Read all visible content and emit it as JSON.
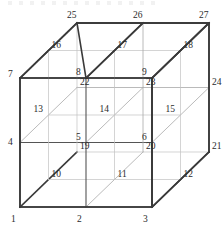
{
  "figure": {
    "type": "diagram",
    "line_colors": {
      "outer_edge": "#3a3a3a",
      "mid_edge": "#555555",
      "inner_edge": "#a8a8a8",
      "faint_edge": "#c2c2c2"
    },
    "label_color": "#2b2b2b"
  },
  "geometry": {
    "origin": {
      "x": 20,
      "y": 207
    },
    "step_x": 66,
    "step_y": -64.5,
    "depth_x": 28.5,
    "depth_y": -27.5,
    "grid": 3
  },
  "vertices": [
    {
      "id": "1",
      "label": "1",
      "i": 0,
      "j": 0,
      "k": 0,
      "lx": -9,
      "ly": 13
    },
    {
      "id": "2",
      "label": "2",
      "i": 1,
      "j": 0,
      "k": 0,
      "lx": -9,
      "ly": 13
    },
    {
      "id": "3",
      "label": "3",
      "i": 2,
      "j": 0,
      "k": 0,
      "lx": -9,
      "ly": 13
    },
    {
      "id": "4",
      "label": "4",
      "i": 0,
      "j": 1,
      "k": 0,
      "lx": -12,
      "ly": 0
    },
    {
      "id": "5",
      "label": "5",
      "i": 1,
      "j": 1,
      "k": 0,
      "lx": -10,
      "ly": -5
    },
    {
      "id": "6",
      "label": "6",
      "i": 2,
      "j": 1,
      "k": 0,
      "lx": -10,
      "ly": -5
    },
    {
      "id": "7",
      "label": "7",
      "i": 0,
      "j": 2,
      "k": 0,
      "lx": -12,
      "ly": -3
    },
    {
      "id": "8",
      "label": "8",
      "i": 1,
      "j": 2,
      "k": 0,
      "lx": -10,
      "ly": -5
    },
    {
      "id": "9",
      "label": "9",
      "i": 2,
      "j": 2,
      "k": 0,
      "lx": -10,
      "ly": -5
    },
    {
      "id": "10",
      "label": "10",
      "i": 0,
      "j": 0,
      "k": 1,
      "lx": 3,
      "ly": -5
    },
    {
      "id": "11",
      "label": "11",
      "i": 1,
      "j": 0,
      "k": 1,
      "lx": 3,
      "ly": -5
    },
    {
      "id": "12",
      "label": "12",
      "i": 2,
      "j": 0,
      "k": 1,
      "lx": 3,
      "ly": -5
    },
    {
      "id": "13",
      "label": "13",
      "i": 0,
      "j": 1,
      "k": 1,
      "lx": -15,
      "ly": -5
    },
    {
      "id": "14",
      "label": "14",
      "i": 1,
      "j": 1,
      "k": 1,
      "lx": -15,
      "ly": -5
    },
    {
      "id": "15",
      "label": "15",
      "i": 2,
      "j": 1,
      "k": 1,
      "lx": -15,
      "ly": -5
    },
    {
      "id": "16",
      "label": "16",
      "i": 0,
      "j": 2,
      "k": 1,
      "lx": 3,
      "ly": -5
    },
    {
      "id": "17",
      "label": "17",
      "i": 1,
      "j": 2,
      "k": 1,
      "lx": 3,
      "ly": -5
    },
    {
      "id": "18",
      "label": "18",
      "i": 2,
      "j": 2,
      "k": 1,
      "lx": 3,
      "ly": -5
    },
    {
      "id": "19",
      "label": "19",
      "i": 0,
      "j": 0,
      "k": 2,
      "lx": 3,
      "ly": -5
    },
    {
      "id": "20",
      "label": "20",
      "i": 1,
      "j": 0,
      "k": 2,
      "lx": 3,
      "ly": -5
    },
    {
      "id": "21",
      "label": "21",
      "i": 2,
      "j": 0,
      "k": 2,
      "lx": 3,
      "ly": -5
    },
    {
      "id": "22",
      "label": "22",
      "i": 0,
      "j": 1,
      "k": 2,
      "lx": 3,
      "ly": -5
    },
    {
      "id": "23",
      "label": "23",
      "i": 1,
      "j": 1,
      "k": 2,
      "lx": 3,
      "ly": -5
    },
    {
      "id": "24",
      "label": "24",
      "i": 2,
      "j": 1,
      "k": 2,
      "lx": 3,
      "ly": -5
    },
    {
      "id": "25",
      "label": "25",
      "i": 0,
      "j": 2,
      "k": 2,
      "lx": -10,
      "ly": -7
    },
    {
      "id": "26",
      "label": "26",
      "i": 1,
      "j": 2,
      "k": 2,
      "lx": -10,
      "ly": -7
    },
    {
      "id": "27",
      "label": "27",
      "i": 2,
      "j": 2,
      "k": 2,
      "lx": -10,
      "ly": -7
    }
  ]
}
